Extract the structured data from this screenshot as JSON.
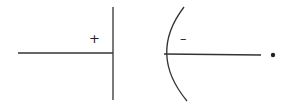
{
  "diagram": {
    "left_plate": {
      "charge_label": "+"
    },
    "right_curve": {
      "charge_label": "–"
    },
    "point": {
      "label": ""
    },
    "colors": {
      "stroke": "#333333",
      "background": "#ffffff"
    }
  }
}
